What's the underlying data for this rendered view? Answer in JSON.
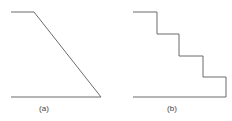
{
  "colors": {
    "stroke": "#6b6b6b",
    "label": "#444444",
    "background": "#ffffff"
  },
  "panels": [
    {
      "id": "a",
      "label": "(a)",
      "shape": "ramp",
      "description": "Sloped profile: flat top, straight diagonal descent to the base line"
    },
    {
      "id": "b",
      "label": "(b)",
      "shape": "staircase",
      "steps": 4,
      "description": "Stepped profile: flat top followed by four discrete steps down to the base line"
    }
  ]
}
